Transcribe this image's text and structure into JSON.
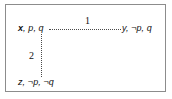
{
  "figure": {
    "type": "relational-model-diagram",
    "border_color": "#8c8c8c",
    "background_color": "#ffffff",
    "text_color": "#111111",
    "edge_color": "#4a4a4a",
    "edge_style": "dotted"
  },
  "worlds": [
    {
      "id": "x",
      "name": "x",
      "valuation_text": ", p, q",
      "full_label": "x, p, q",
      "position": "top-left"
    },
    {
      "id": "y",
      "name": "y",
      "valuation_text": ", ¬p, q",
      "full_label": "y, ¬p, q",
      "position": "top-right"
    },
    {
      "id": "z",
      "name": "z",
      "valuation_text": ", ¬p, ¬q",
      "full_label": "z, ¬p, ¬q",
      "position": "bottom-left"
    }
  ],
  "edges": [
    {
      "id": "edge-1",
      "label": "1",
      "from": "x",
      "to": "y",
      "orientation": "horizontal"
    },
    {
      "id": "edge-2",
      "label": "2",
      "from": "x",
      "to": "z",
      "orientation": "vertical"
    }
  ]
}
